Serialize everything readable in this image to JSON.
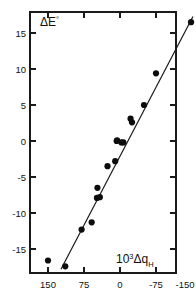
{
  "chart_data": {
    "type": "scatter",
    "title": "",
    "subtitle": "",
    "xlabel": "10³Δq_H",
    "ylabel": "ΔE°",
    "xlabel_parts": {
      "base": "10",
      "exponent": "3",
      "symbol": "Δq",
      "subscript": "H"
    },
    "ylabel_parts": {
      "symbol": "ΔE",
      "superscript": "°"
    },
    "grid": false,
    "legend": "none",
    "x_reversed": true,
    "xlim": [
      187,
      -187
    ],
    "ylim": [
      -17.8,
      17.3
    ],
    "xticks": [
      150,
      75,
      0,
      -75,
      -150
    ],
    "xtick_labels": [
      "150",
      "75",
      "0",
      "-75",
      "-150"
    ],
    "yticks": [
      15,
      10,
      5,
      0,
      -5,
      -10,
      -15
    ],
    "ytick_labels": [
      "15",
      "10",
      "5",
      "0",
      "-5",
      "-10",
      "-15"
    ],
    "frame": "box",
    "tick_direction": "in",
    "marker": "filled-circle",
    "marker_color": "#0d0d0d",
    "line_color": "#1a1a1a",
    "points": [
      {
        "x": 150,
        "y": -16.6
      },
      {
        "x": 114,
        "y": -17.4
      },
      {
        "x": 80,
        "y": -12.3
      },
      {
        "x": 59,
        "y": -11.3
      },
      {
        "x": 48,
        "y": -7.9
      },
      {
        "x": 42,
        "y": -7.8
      },
      {
        "x": 47,
        "y": -6.5
      },
      {
        "x": 26,
        "y": -3.5
      },
      {
        "x": 10,
        "y": -2.8
      },
      {
        "x": 7,
        "y": 0.0
      },
      {
        "x": 6,
        "y": 0.1
      },
      {
        "x": -3,
        "y": -0.2
      },
      {
        "x": -7,
        "y": -0.2
      },
      {
        "x": -25,
        "y": 2.6
      },
      {
        "x": -22,
        "y": 3.1
      },
      {
        "x": -50,
        "y": 5.0
      },
      {
        "x": -75,
        "y": 9.4
      },
      {
        "x": -148,
        "y": 16.5
      }
    ],
    "fit_line": {
      "type": "linear-regression",
      "x_start": 123,
      "y_start": -17.8,
      "x_end": -152,
      "y_end": 17.3
    }
  }
}
